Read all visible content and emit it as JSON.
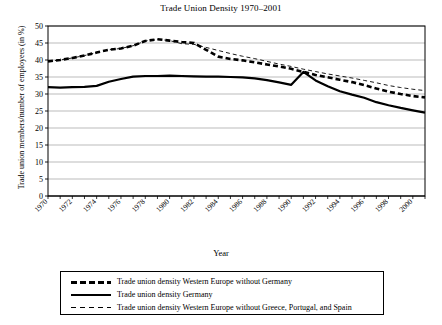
{
  "chart_data": {
    "type": "line",
    "title": "Trade Union Density 1970–2001",
    "xlabel": "Year",
    "ylabel": "Trade union members/number of employees (in %)",
    "xlim": [
      1970,
      2001
    ],
    "ylim": [
      0,
      50
    ],
    "ytick_step": 5,
    "yticks": [
      0,
      5,
      10,
      15,
      20,
      25,
      30,
      35,
      40,
      45,
      50
    ],
    "xticks": [
      1970,
      1971,
      1972,
      1973,
      1974,
      1975,
      1976,
      1977,
      1978,
      1979,
      1980,
      1981,
      1982,
      1983,
      1984,
      1985,
      1986,
      1987,
      1988,
      1989,
      1990,
      1991,
      1992,
      1993,
      1994,
      1995,
      1996,
      1997,
      1998,
      1999,
      2000,
      2001
    ],
    "xtick_labels": [
      "1970",
      "",
      "1972",
      "",
      "1974",
      "",
      "1976",
      "",
      "1978",
      "",
      "1980",
      "",
      "1982",
      "",
      "1984",
      "",
      "1986",
      "",
      "1988",
      "",
      "1990",
      "",
      "1992",
      "",
      "1994",
      "",
      "1996",
      "",
      "1998",
      "",
      "2000",
      ""
    ],
    "grid": "horizontal",
    "legend_position": "bottom",
    "x": [
      1970,
      1971,
      1972,
      1973,
      1974,
      1975,
      1976,
      1977,
      1978,
      1979,
      1980,
      1981,
      1982,
      1983,
      1984,
      1985,
      1986,
      1987,
      1988,
      1989,
      1990,
      1991,
      1992,
      1993,
      1994,
      1995,
      1996,
      1997,
      1998,
      1999,
      2000,
      2001
    ],
    "series": [
      {
        "name": "Trade union density Western Europe without Germany",
        "style": "thick-dashed",
        "color": "#000000",
        "values": [
          39.6,
          40.0,
          40.6,
          41.3,
          42.2,
          43.0,
          43.4,
          44.2,
          45.6,
          46.1,
          45.7,
          45.3,
          45.0,
          43.0,
          41.0,
          40.3,
          39.9,
          39.3,
          38.7,
          38.1,
          37.4,
          36.5,
          35.6,
          34.9,
          34.2,
          33.5,
          32.6,
          31.6,
          30.7,
          30.0,
          29.4,
          29.0
        ]
      },
      {
        "name": "Trade union density Germany",
        "style": "solid",
        "color": "#000000",
        "values": [
          32.0,
          31.9,
          32.0,
          32.1,
          32.4,
          33.6,
          34.4,
          35.1,
          35.3,
          35.3,
          35.4,
          35.3,
          35.2,
          35.1,
          35.1,
          35.0,
          34.9,
          34.6,
          34.1,
          33.4,
          32.7,
          36.5,
          34.0,
          32.3,
          30.8,
          29.8,
          28.9,
          27.6,
          26.7,
          25.9,
          25.2,
          24.5
        ]
      },
      {
        "name": "Trade union density Western Europe without Greece, Portugal, and Spain",
        "style": "thin-dashed",
        "color": "#000000",
        "values": [
          39.6,
          40.0,
          40.6,
          41.3,
          42.2,
          43.0,
          43.4,
          44.2,
          45.6,
          46.1,
          45.7,
          44.8,
          44.6,
          43.7,
          42.8,
          41.9,
          41.1,
          40.4,
          39.6,
          38.8,
          38.1,
          37.3,
          36.6,
          35.9,
          35.3,
          34.7,
          34.0,
          33.3,
          32.5,
          31.9,
          31.4,
          31.0
        ]
      }
    ]
  },
  "legend": {
    "entries": [
      {
        "label": "Trade union density Western Europe without Germany",
        "style": "thick-dashed"
      },
      {
        "label": "Trade union density Germany",
        "style": "solid"
      },
      {
        "label": "Trade union density Western Europe without Greece, Portugal, and Spain",
        "style": "thin-dashed"
      }
    ]
  }
}
